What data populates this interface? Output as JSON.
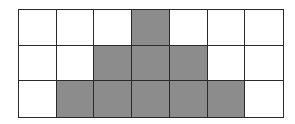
{
  "diagram": {
    "type": "grid",
    "rows": 3,
    "columns": 7,
    "colors": {
      "filled": "#8c8c8c",
      "empty": "#ffffff",
      "border": "#2a2a2a"
    },
    "cells": [
      [
        0,
        0,
        0,
        1,
        0,
        0,
        0
      ],
      [
        0,
        0,
        1,
        1,
        1,
        0,
        0
      ],
      [
        0,
        1,
        1,
        1,
        1,
        1,
        0
      ]
    ]
  }
}
